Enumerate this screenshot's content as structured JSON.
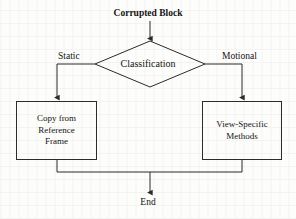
{
  "diagram": {
    "type": "flowchart",
    "background_color": "#fdfdfc",
    "line_color": "#2b2b2b",
    "text_color": "#141414",
    "start": {
      "label": "Corrupted Block",
      "shape": "text",
      "x": 150,
      "y": 13
    },
    "decision": {
      "label": "Classification",
      "shape": "diamond",
      "cx": 150,
      "cy": 64,
      "width": 110,
      "height": 46
    },
    "branches": [
      {
        "label": "Static",
        "side": "left",
        "x": 74,
        "y": 57
      },
      {
        "label": "Motional",
        "side": "right",
        "x": 246,
        "y": 57
      }
    ],
    "processes": [
      {
        "id": "left-process",
        "label": "Copy from\nReference\nFrame",
        "shape": "rectangle",
        "x": 16,
        "y": 101,
        "width": 81,
        "height": 59
      },
      {
        "id": "right-process",
        "label": "View-Specific\nMethods",
        "shape": "rectangle",
        "x": 202,
        "y": 101,
        "width": 80,
        "height": 59
      }
    ],
    "end": {
      "label": "End",
      "shape": "text",
      "x": 150,
      "y": 203
    },
    "connectors": [
      {
        "id": "start-to-decision",
        "from": "Corrupted Block",
        "to": "Classification",
        "arrow": true
      },
      {
        "id": "decision-to-left",
        "from": "Classification",
        "to": "Copy from Reference Frame",
        "label": "Static",
        "arrow": true
      },
      {
        "id": "decision-to-right",
        "from": "Classification",
        "to": "View-Specific Methods",
        "label": "Motional",
        "arrow": true
      },
      {
        "id": "left-to-end",
        "from": "Copy from Reference Frame",
        "to": "End",
        "arrow": true
      },
      {
        "id": "right-to-end",
        "from": "View-Specific Methods",
        "to": "End",
        "arrow": true
      }
    ]
  },
  "ghost_text": "  of  the  b ck  wh n  the  e  c de  r  m y          \n     e  i n  th   e r  o   n   c   d  a   s   w  he\n     a  t  o    re u t   n   h   n     o  a  d   t  e\n  n    e  h  g  e    o   c  a  s  f  e   t  o   n  th\n     d   s  r b  t    n   f    h   m   t  o  n  v  e\n   o   t e   e   r   n   e    r  m   n   h   p   e\n       n  s  a  c   o   h   s   a  t  e   r  s  u  t\n   s     o   m     r  v  e    y   h   b  o  c   s"
}
